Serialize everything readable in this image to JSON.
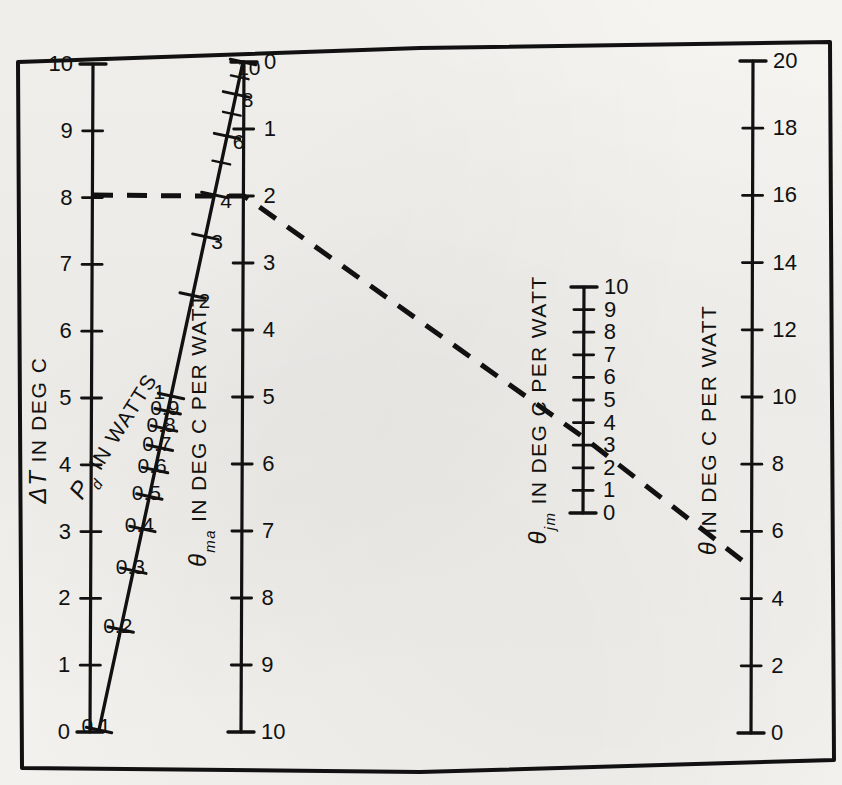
{
  "figure": {
    "type": "nomogram",
    "border": {
      "color": "#111111",
      "width": 4
    },
    "background": "#f3f2ee"
  },
  "chart_data": {
    "type": "line",
    "title": "",
    "subtitle": "",
    "xlabel": "",
    "ylabel": "",
    "grid": false,
    "legend": "none",
    "axes": [
      {
        "id": "delta-t",
        "name": "delta-t-axis",
        "label": "ΔT IN DEG C",
        "label_symbol": "ΔT",
        "label_rest": "IN DEG C",
        "units": "DEG C",
        "orientation": "vertical",
        "direction": "up",
        "min": 0,
        "max": 10,
        "ticks": [
          0,
          1,
          2,
          3,
          4,
          5,
          6,
          7,
          8,
          9,
          10
        ],
        "tick_labels": [
          "0",
          "1",
          "2",
          "3",
          "4",
          "5",
          "6",
          "7",
          "8",
          "9",
          "10"
        ],
        "label_side": "left",
        "x_top": 93,
        "y_top": 64,
        "x_bottom": 90,
        "y_bottom": 732
      },
      {
        "id": "pd",
        "name": "pd-scale",
        "label": "P_d IN WATTS",
        "label_symbol": "P",
        "label_sub": "d",
        "label_rest": "IN WATTS",
        "units": "WATTS",
        "orientation": "slanted",
        "direction": "up",
        "min": 0,
        "max": 10,
        "scale": "logarithmic",
        "ticks": [
          0.1,
          0.2,
          0.3,
          0.4,
          0.5,
          0.6,
          0.7,
          0.8,
          0.9,
          1,
          2,
          3,
          4,
          5,
          6,
          7,
          8,
          9,
          10
        ],
        "tick_labels": [
          "0.1",
          "0.2",
          "0.3",
          "0.4",
          "0.5",
          "0.6",
          "0.7",
          "0.8",
          "0.9",
          "1",
          "2",
          "3",
          "4",
          "5",
          "6",
          "7",
          "8",
          "9",
          "10"
        ],
        "labeled_ticks": [
          "0.1",
          "0.2",
          "0.3",
          "0.4",
          "0.5",
          "0.6",
          "0.7",
          "0.8",
          "0.9",
          "1",
          "2",
          "3",
          "4",
          "6",
          "8",
          "10"
        ],
        "label_side": "mixed",
        "x_top": 243,
        "y_top": 62,
        "x_bottom": 99,
        "y_bottom": 730
      },
      {
        "id": "theta-ma",
        "name": "theta-ma-axis",
        "label": "θma IN DEG C PER WATT",
        "label_symbol": "θ",
        "label_sub": "ma",
        "label_rest": "IN DEG C PER WATT",
        "units": "DEG C PER WATT",
        "orientation": "vertical",
        "direction": "down",
        "min": 0,
        "max": 10,
        "ticks": [
          0,
          1,
          2,
          3,
          4,
          5,
          6,
          7,
          8,
          9,
          10
        ],
        "tick_labels": [
          "0",
          "1",
          "2",
          "3",
          "4",
          "5",
          "6",
          "7",
          "8",
          "9",
          "10"
        ],
        "label_side": "right",
        "x_top": 244,
        "y_top": 62,
        "x_bottom": 241,
        "y_bottom": 732
      },
      {
        "id": "theta-jm",
        "name": "theta-jm-axis",
        "label": "θjm IN DEG C PER WATT",
        "label_symbol": "θ",
        "label_sub": "jm",
        "label_rest": "IN DEG C PER WATT",
        "units": "DEG C PER WATT",
        "orientation": "vertical",
        "direction": "up",
        "min": 0,
        "max": 10,
        "ticks": [
          0,
          1,
          2,
          3,
          4,
          5,
          6,
          7,
          8,
          9,
          10
        ],
        "tick_labels": [
          "0",
          "1",
          "2",
          "3",
          "4",
          "5",
          "6",
          "7",
          "8",
          "9",
          "10"
        ],
        "label_side": "right",
        "x_top": 584,
        "y_top": 287,
        "x_bottom": 583,
        "y_bottom": 513
      },
      {
        "id": "theta",
        "name": "theta-axis",
        "label": "θ IN DEG C PER WATT",
        "label_symbol": "θ",
        "label_sub": "",
        "label_rest": "IN DEG C PER WATT",
        "units": "DEG C PER WATT",
        "orientation": "vertical",
        "direction": "up",
        "min": 0,
        "max": 20,
        "ticks": [
          0,
          2,
          4,
          6,
          8,
          10,
          12,
          14,
          16,
          18,
          20
        ],
        "tick_labels": [
          "0",
          "2",
          "4",
          "6",
          "8",
          "10",
          "12",
          "14",
          "16",
          "18",
          "20"
        ],
        "label_side": "right",
        "x_top": 753,
        "y_top": 61,
        "x_bottom": 751,
        "y_bottom": 733
      }
    ],
    "construction_line": {
      "name": "construction-line",
      "style": "dashed",
      "color": "#111111",
      "width": 5,
      "points": [
        {
          "label": "ΔT = 8",
          "axis": "delta-t",
          "value": 8,
          "x": 93,
          "y": 195
        },
        {
          "label": "P_d = 0.4",
          "axis": "pd",
          "value": 0.4,
          "x": 200,
          "y": 196
        },
        {
          "label": "θma = 2",
          "axis": "theta-ma",
          "value": 2,
          "x": 244,
          "y": 196
        },
        {
          "label": "θjm = 3",
          "axis": "theta-jm",
          "value": 3,
          "x": 583,
          "y": 437
        },
        {
          "label": "θ = 5",
          "axis": "theta",
          "value": 5,
          "x": 752,
          "y": 568
        }
      ]
    },
    "series": [
      {
        "name": "P_d scale line",
        "type": "scale-line",
        "color": "#111111"
      },
      {
        "name": "construction line",
        "type": "dashed-index-line",
        "color": "#111111"
      }
    ]
  }
}
